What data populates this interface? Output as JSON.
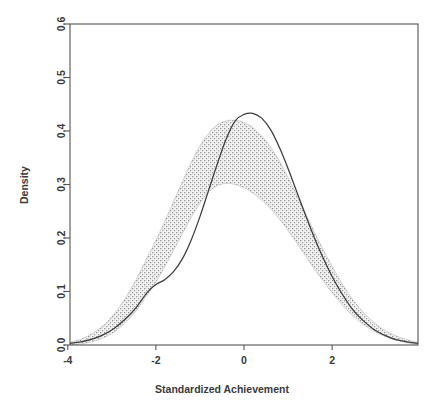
{
  "chart_data": {
    "type": "line",
    "title": "",
    "subtitle": "",
    "xlabel": "Standardized Achievement",
    "ylabel": "Density",
    "xlim": [
      -3.95,
      3.95
    ],
    "ylim": [
      0.0,
      0.6
    ],
    "grid": false,
    "legend": "none",
    "x_ticks": [
      -4,
      -2,
      0,
      2
    ],
    "x_tick_labels": [
      "-4",
      "-2",
      "0",
      "2"
    ],
    "y_ticks": [
      0.0,
      0.1,
      0.2,
      0.3,
      0.4,
      0.5,
      0.6
    ],
    "y_tick_labels": [
      "0.0",
      "0.1",
      "0.2",
      "0.3",
      "0.4",
      "0.5",
      "0.6"
    ],
    "colors": {
      "band_fill": "#a8a8a8",
      "curve_line": "#3c3c3c",
      "axis": "#4a4a4a",
      "background": "#ffffff"
    },
    "x": [
      -3.95,
      -3.7,
      -3.45,
      -3.2,
      -2.95,
      -2.7,
      -2.45,
      -2.2,
      -2.0,
      -1.8,
      -1.6,
      -1.4,
      -1.2,
      -1.0,
      -0.8,
      -0.6,
      -0.4,
      -0.2,
      0.0,
      0.2,
      0.4,
      0.6,
      0.8,
      1.0,
      1.2,
      1.4,
      1.6,
      1.8,
      2.0,
      2.2,
      2.45,
      2.7,
      2.95,
      3.2,
      3.45,
      3.7,
      3.95
    ],
    "series": [
      {
        "name": "Observed density",
        "type": "line",
        "values": [
          0.003,
          0.006,
          0.011,
          0.019,
          0.031,
          0.048,
          0.07,
          0.098,
          0.113,
          0.122,
          0.137,
          0.161,
          0.196,
          0.24,
          0.29,
          0.34,
          0.386,
          0.419,
          0.431,
          0.433,
          0.424,
          0.403,
          0.37,
          0.33,
          0.286,
          0.242,
          0.2,
          0.162,
          0.128,
          0.099,
          0.068,
          0.046,
          0.029,
          0.018,
          0.01,
          0.006,
          0.003
        ]
      },
      {
        "name": "Simulated band upper bound",
        "type": "band_upper",
        "values": [
          0.005,
          0.011,
          0.021,
          0.036,
          0.058,
          0.087,
          0.122,
          0.163,
          0.196,
          0.231,
          0.268,
          0.305,
          0.341,
          0.372,
          0.396,
          0.412,
          0.419,
          0.42,
          0.416,
          0.406,
          0.391,
          0.37,
          0.344,
          0.313,
          0.28,
          0.245,
          0.211,
          0.178,
          0.147,
          0.118,
          0.087,
          0.062,
          0.042,
          0.027,
          0.017,
          0.01,
          0.005
        ]
      },
      {
        "name": "Simulated band lower bound",
        "type": "band_lower",
        "values": [
          0.0,
          0.002,
          0.006,
          0.013,
          0.024,
          0.041,
          0.064,
          0.093,
          0.118,
          0.146,
          0.177,
          0.208,
          0.238,
          0.265,
          0.286,
          0.298,
          0.302,
          0.3,
          0.294,
          0.284,
          0.271,
          0.255,
          0.236,
          0.214,
          0.191,
          0.166,
          0.142,
          0.119,
          0.098,
          0.078,
          0.056,
          0.039,
          0.026,
          0.016,
          0.009,
          0.004,
          0.001
        ]
      }
    ],
    "annotations": [
      {
        "text": "Peak of observed density curve",
        "x": 0.2,
        "y": 0.433
      },
      {
        "text": "Peak of upper band",
        "x": -0.2,
        "y": 0.42
      },
      {
        "text": "Shoulder where curve exits lower band",
        "x": -1.9,
        "y": 0.12
      }
    ]
  },
  "axes": {
    "x_title": "Standardized Achievement",
    "y_title": "Density"
  }
}
